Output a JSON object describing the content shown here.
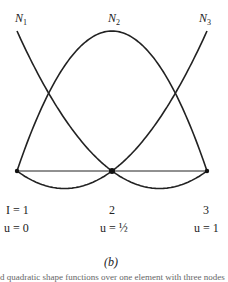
{
  "figure": {
    "curve_labels": [
      {
        "name": "N",
        "sub": "1"
      },
      {
        "name": "N",
        "sub": "2"
      },
      {
        "name": "N",
        "sub": "3"
      }
    ],
    "nodes": [
      {
        "index_label": "I = 1",
        "u_label": "u = 0"
      },
      {
        "index_label": "2",
        "u_label": "u = ½"
      },
      {
        "index_label": "3",
        "u_label": "u = 1"
      }
    ],
    "caption": "(b)",
    "cut_text": "d  quadratic shape functions over one element with three nodes"
  },
  "chart_data": {
    "type": "line",
    "title": "",
    "xlabel": "u",
    "ylabel": "",
    "x": [
      0,
      0.25,
      0.5,
      0.75,
      1
    ],
    "series": [
      {
        "name": "N1",
        "values": [
          1,
          0.375,
          0,
          -0.125,
          0
        ]
      },
      {
        "name": "N2",
        "values": [
          0,
          0.75,
          1,
          0.75,
          0
        ]
      },
      {
        "name": "N3",
        "values": [
          0,
          -0.125,
          0,
          0.375,
          1
        ]
      }
    ],
    "node_positions": [
      0,
      0.5,
      1
    ],
    "grid": false,
    "legend": "inline labels"
  }
}
